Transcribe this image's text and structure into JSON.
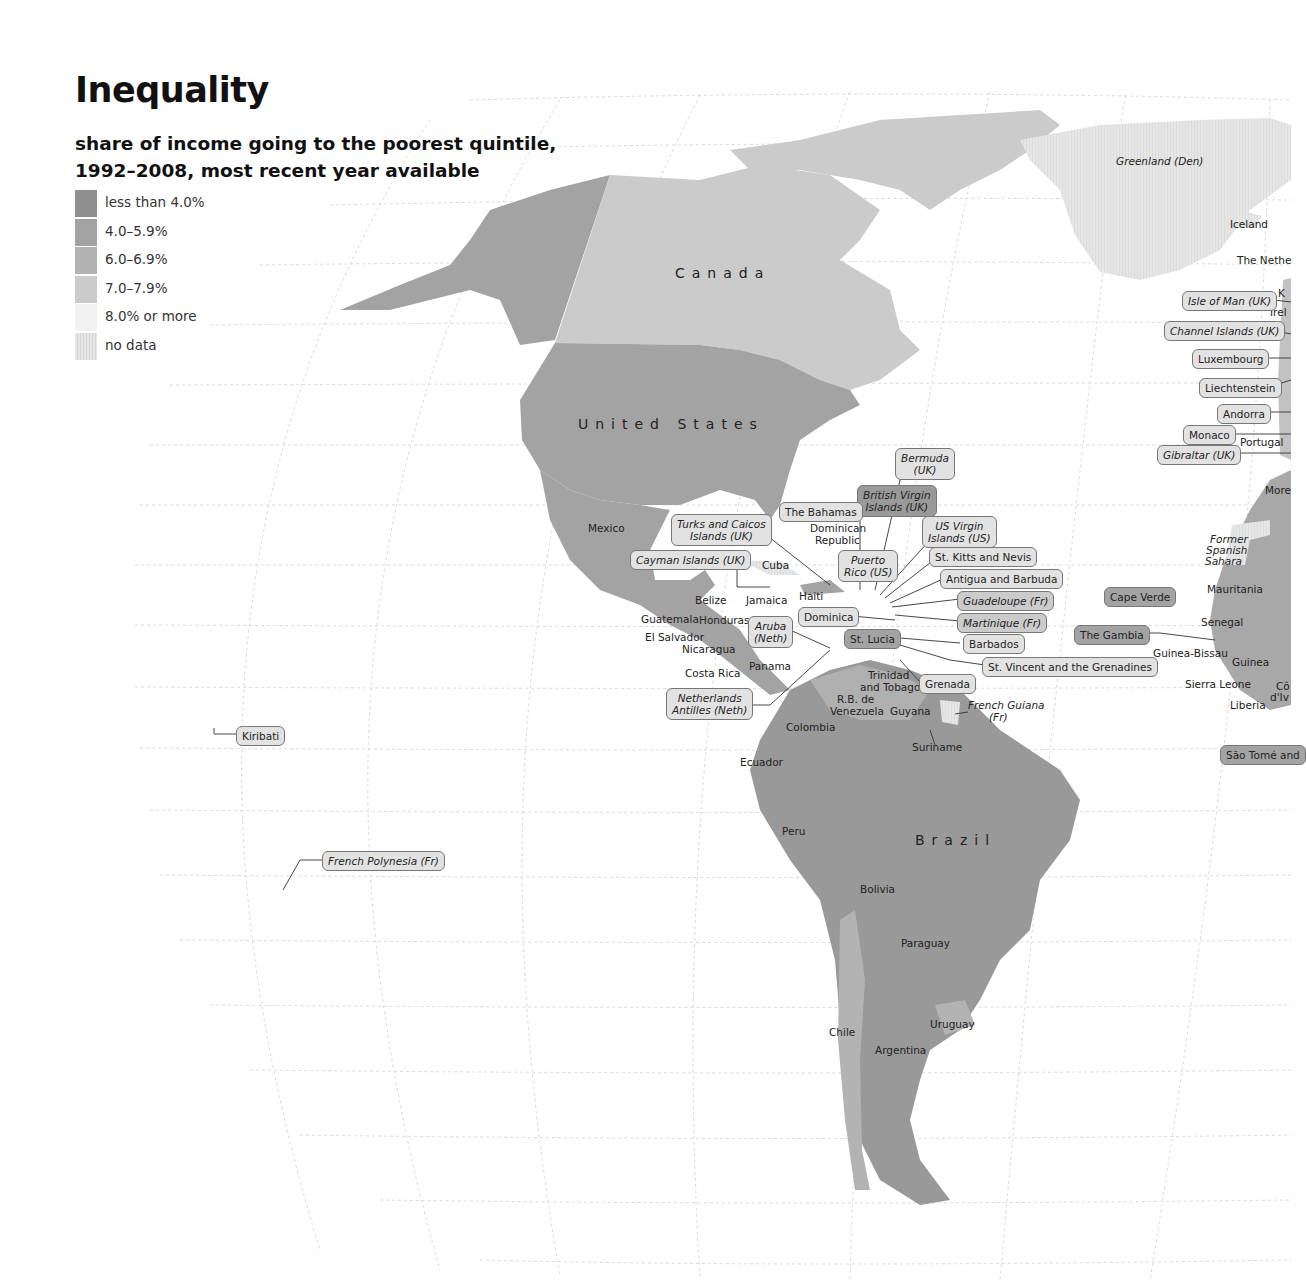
{
  "title": "Inequality",
  "subtitle_line1": "share of income going to the poorest quintile,",
  "subtitle_line2": "1992–2008, most recent year available",
  "legend": [
    {
      "label": "less than 4.0%",
      "color": "#8f8f8f"
    },
    {
      "label": "4.0–5.9%",
      "color": "#a3a3a3"
    },
    {
      "label": "6.0–6.9%",
      "color": "#b3b3b3"
    },
    {
      "label": "7.0–7.9%",
      "color": "#cbcbcb"
    },
    {
      "label": "8.0% or more",
      "color": "#f2f2f2"
    },
    {
      "label": "no data",
      "color": "#e2e2e2"
    }
  ],
  "chart_data": {
    "type": "choropleth-map",
    "title": "Inequality",
    "subtitle": "share of income going to the poorest quintile, 1992–2008, most recent year available",
    "legend_position": "top-left",
    "categories": [
      "less than 4.0%",
      "4.0–5.9%",
      "6.0–6.9%",
      "7.0–7.9%",
      "8.0% or more",
      "no data"
    ],
    "regions": [
      {
        "name": "Canada",
        "category": "7.0–7.9%"
      },
      {
        "name": "United States",
        "category": "4.0–5.9%"
      },
      {
        "name": "Greenland (Den)",
        "category": "no data"
      },
      {
        "name": "Iceland",
        "category": "no data"
      },
      {
        "name": "Mexico",
        "category": "4.0–5.9%"
      },
      {
        "name": "Guatemala",
        "category": "less than 4.0%"
      },
      {
        "name": "Honduras",
        "category": "less than 4.0%"
      },
      {
        "name": "El Salvador",
        "category": "4.0–5.9%"
      },
      {
        "name": "Nicaragua",
        "category": "4.0–5.9%"
      },
      {
        "name": "Costa Rica",
        "category": "4.0–5.9%"
      },
      {
        "name": "Panama",
        "category": "less than 4.0%"
      },
      {
        "name": "Belize",
        "category": "no data"
      },
      {
        "name": "Cuba",
        "category": "no data"
      },
      {
        "name": "Jamaica",
        "category": "6.0–6.9%"
      },
      {
        "name": "Haiti",
        "category": "less than 4.0%"
      },
      {
        "name": "Dominican Republic",
        "category": "4.0–5.9%"
      },
      {
        "name": "R.B. de Venezuela",
        "category": "4.0–5.9%"
      },
      {
        "name": "Trinidad and Tobago",
        "category": "4.0–5.9%"
      },
      {
        "name": "Guyana",
        "category": "4.0–5.9%"
      },
      {
        "name": "Suriname",
        "category": "no data"
      },
      {
        "name": "French Guiana (Fr)",
        "category": "no data"
      },
      {
        "name": "Colombia",
        "category": "less than 4.0%"
      },
      {
        "name": "Ecuador",
        "category": "4.0–5.9%"
      },
      {
        "name": "Peru",
        "category": "4.0–5.9%"
      },
      {
        "name": "Brazil",
        "category": "less than 4.0%"
      },
      {
        "name": "Bolivia",
        "category": "less than 4.0%"
      },
      {
        "name": "Paraguay",
        "category": "less than 4.0%"
      },
      {
        "name": "Chile",
        "category": "4.0–5.9%"
      },
      {
        "name": "Argentina",
        "category": "4.0–5.9%"
      },
      {
        "name": "Uruguay",
        "category": "4.0–5.9%"
      },
      {
        "name": "St. Lucia",
        "category": "4.0–5.9%"
      },
      {
        "name": "British Virgin Islands (UK)",
        "category": "less than 4.0%"
      },
      {
        "name": "Cape Verde",
        "category": "4.0–5.9%"
      },
      {
        "name": "The Gambia",
        "category": "4.0–5.9%"
      },
      {
        "name": "Senegal",
        "category": "6.0–6.9%"
      },
      {
        "name": "Mauritania",
        "category": "6.0–6.9%"
      },
      {
        "name": "Guinea",
        "category": "6.0–6.9%"
      },
      {
        "name": "Former Spanish Sahara",
        "category": "no data"
      }
    ]
  },
  "map": {
    "big_labels": {
      "canada": "Canada",
      "united_states": "United States",
      "brazil": "Brazil"
    },
    "plain_labels": [
      {
        "text": "Mexico",
        "x": 588,
        "y": 522
      },
      {
        "text": "Dominican",
        "x": 810,
        "y": 522
      },
      {
        "text": "Republic",
        "x": 815,
        "y": 534
      },
      {
        "text": "Cuba",
        "x": 762,
        "y": 559
      },
      {
        "text": "Belize",
        "x": 695,
        "y": 594
      },
      {
        "text": "Jamaica",
        "x": 746,
        "y": 594
      },
      {
        "text": "Haiti",
        "x": 799,
        "y": 590
      },
      {
        "text": "Guatemala",
        "x": 641,
        "y": 613
      },
      {
        "text": "Honduras",
        "x": 699,
        "y": 614
      },
      {
        "text": "El Salvador",
        "x": 645,
        "y": 631
      },
      {
        "text": "Nicaragua",
        "x": 682,
        "y": 643
      },
      {
        "text": "Costa Rica",
        "x": 685,
        "y": 667
      },
      {
        "text": "Panama",
        "x": 749,
        "y": 660
      },
      {
        "text": "Trinidad",
        "x": 868,
        "y": 669
      },
      {
        "text": "and Tobago",
        "x": 860,
        "y": 681
      },
      {
        "text": "R.B. de",
        "x": 837,
        "y": 693
      },
      {
        "text": "Venezuela",
        "x": 830,
        "y": 705
      },
      {
        "text": "Guyana",
        "x": 890,
        "y": 705
      },
      {
        "text": "Colombia",
        "x": 786,
        "y": 721
      },
      {
        "text": "Suriname",
        "x": 912,
        "y": 741
      },
      {
        "text": "Ecuador",
        "x": 740,
        "y": 756
      },
      {
        "text": "Peru",
        "x": 782,
        "y": 825
      },
      {
        "text": "Bolivia",
        "x": 860,
        "y": 883
      },
      {
        "text": "Paraguay",
        "x": 901,
        "y": 937
      },
      {
        "text": "Uruguay",
        "x": 930,
        "y": 1018
      },
      {
        "text": "Chile",
        "x": 829,
        "y": 1026
      },
      {
        "text": "Argentina",
        "x": 875,
        "y": 1044
      },
      {
        "text": "Iceland",
        "x": 1230,
        "y": 218
      },
      {
        "text": "The Nethe",
        "x": 1237,
        "y": 254
      },
      {
        "text": "K",
        "x": 1278,
        "y": 287
      },
      {
        "text": "Irel",
        "x": 1270,
        "y": 306
      },
      {
        "text": "Portugal",
        "x": 1240,
        "y": 436
      },
      {
        "text": "More",
        "x": 1265,
        "y": 484
      },
      {
        "text": "Mauritania",
        "x": 1207,
        "y": 583
      },
      {
        "text": "Senegal",
        "x": 1201,
        "y": 616
      },
      {
        "text": "Guinea-Bissau",
        "x": 1153,
        "y": 647
      },
      {
        "text": "Guinea",
        "x": 1232,
        "y": 656
      },
      {
        "text": "Sierra Leone",
        "x": 1185,
        "y": 678
      },
      {
        "text": "Cô",
        "x": 1276,
        "y": 680
      },
      {
        "text": "d'Iv",
        "x": 1270,
        "y": 691
      },
      {
        "text": "Liberia",
        "x": 1230,
        "y": 699
      }
    ],
    "italic_labels": [
      {
        "text": "Greenland (Den)",
        "x": 1116,
        "y": 155
      },
      {
        "text": "Former",
        "x": 1210,
        "y": 533
      },
      {
        "text": "Spanish",
        "x": 1206,
        "y": 544
      },
      {
        "text": "Sahara",
        "x": 1205,
        "y": 555
      },
      {
        "text": "French Guiana",
        "x": 968,
        "y": 699
      },
      {
        "text": "(Fr)",
        "x": 989,
        "y": 711
      }
    ],
    "callouts": [
      {
        "text": "Bermuda\n(UK)",
        "x": 895,
        "y": 448,
        "italic": true,
        "fill": "#e2e2e2"
      },
      {
        "text": "British Virgin\nIslands (UK)",
        "x": 857,
        "y": 485,
        "italic": true,
        "fill": "#9a9a9a"
      },
      {
        "text": "The Bahamas",
        "x": 779,
        "y": 502,
        "italic": false,
        "fill": "#e2e2e2"
      },
      {
        "text": "Turks and Caicos\nIslands (UK)",
        "x": 671,
        "y": 514,
        "italic": true,
        "fill": "#e2e2e2"
      },
      {
        "text": "US Virgin\nIslands (US)",
        "x": 922,
        "y": 516,
        "italic": true,
        "fill": "#e2e2e2"
      },
      {
        "text": "Cayman Islands (UK)",
        "x": 630,
        "y": 550,
        "italic": true,
        "fill": "#e2e2e2"
      },
      {
        "text": "Puerto\nRico (US)",
        "x": 838,
        "y": 550,
        "italic": true,
        "fill": "#e2e2e2"
      },
      {
        "text": "St. Kitts and Nevis",
        "x": 929,
        "y": 547,
        "italic": false,
        "fill": "#e2e2e2"
      },
      {
        "text": "Antigua and Barbuda",
        "x": 940,
        "y": 569,
        "italic": false,
        "fill": "#e2e2e2"
      },
      {
        "text": "Guadeloupe (Fr)",
        "x": 957,
        "y": 591,
        "italic": true,
        "fill": "#cbcbcb"
      },
      {
        "text": "Martinique (Fr)",
        "x": 957,
        "y": 613,
        "italic": true,
        "fill": "#cbcbcb"
      },
      {
        "text": "Dominica",
        "x": 798,
        "y": 607,
        "italic": false,
        "fill": "#e2e2e2"
      },
      {
        "text": "Aruba\n(Neth)",
        "x": 748,
        "y": 616,
        "italic": true,
        "fill": "#e2e2e2"
      },
      {
        "text": "St. Lucia",
        "x": 844,
        "y": 629,
        "italic": false,
        "fill": "#a3a3a3"
      },
      {
        "text": "Barbados",
        "x": 963,
        "y": 634,
        "italic": false,
        "fill": "#e2e2e2"
      },
      {
        "text": "St. Vincent and the Grenadines",
        "x": 982,
        "y": 657,
        "italic": false,
        "fill": "#e2e2e2"
      },
      {
        "text": "Grenada",
        "x": 919,
        "y": 674,
        "italic": false,
        "fill": "#e2e2e2"
      },
      {
        "text": "Netherlands\nAntilles (Neth)",
        "x": 666,
        "y": 688,
        "italic": true,
        "fill": "#e2e2e2"
      },
      {
        "text": "Cape Verde",
        "x": 1104,
        "y": 587,
        "italic": false,
        "fill": "#a3a3a3"
      },
      {
        "text": "The Gambia",
        "x": 1074,
        "y": 625,
        "italic": false,
        "fill": "#a3a3a3"
      },
      {
        "text": "Kiribati",
        "x": 236,
        "y": 726,
        "italic": false,
        "fill": "#e2e2e2"
      },
      {
        "text": "French Polynesia (Fr)",
        "x": 322,
        "y": 851,
        "italic": true,
        "fill": "#e2e2e2"
      },
      {
        "text": "Isle of Man (UK)",
        "x": 1182,
        "y": 291,
        "italic": true,
        "fill": "#e2e2e2"
      },
      {
        "text": "Channel Islands (UK)",
        "x": 1164,
        "y": 321,
        "italic": true,
        "fill": "#e2e2e2"
      },
      {
        "text": "Luxembourg",
        "x": 1192,
        "y": 349,
        "italic": false,
        "fill": "#e2e2e2"
      },
      {
        "text": "Liechtenstein",
        "x": 1199,
        "y": 378,
        "italic": false,
        "fill": "#e2e2e2"
      },
      {
        "text": "Andorra",
        "x": 1217,
        "y": 404,
        "italic": false,
        "fill": "#e2e2e2"
      },
      {
        "text": "Monaco",
        "x": 1183,
        "y": 425,
        "italic": false,
        "fill": "#e2e2e2"
      },
      {
        "text": "Gibraltar (UK)",
        "x": 1157,
        "y": 445,
        "italic": true,
        "fill": "#e2e2e2"
      },
      {
        "text": "São Tomé and",
        "x": 1220,
        "y": 745,
        "italic": false,
        "fill": "#a3a3a3"
      }
    ]
  }
}
